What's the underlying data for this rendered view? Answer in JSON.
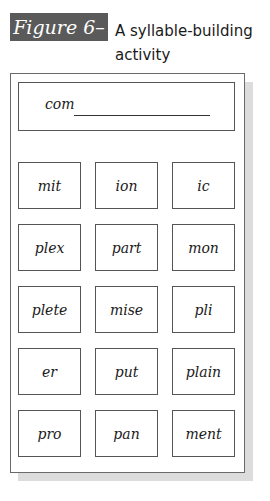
{
  "figure": {
    "label": "Figure 6–8",
    "caption": "A syllable-building activity",
    "label_bg_color": "#5a5a5a"
  },
  "activity": {
    "prefix": "com",
    "blank": "",
    "syllables": [
      [
        "mit",
        "ion",
        "ic"
      ],
      [
        "plex",
        "part",
        "mon"
      ],
      [
        "plete",
        "mise",
        "pli"
      ],
      [
        "er",
        "put",
        "plain"
      ],
      [
        "pro",
        "pan",
        "ment"
      ]
    ]
  }
}
